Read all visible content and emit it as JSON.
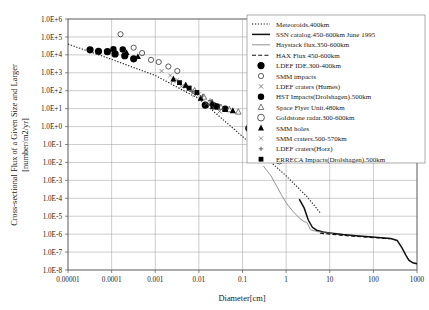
{
  "chart_data": {
    "type": "scatter",
    "title": "",
    "xlabel": "Diameter[cm]",
    "ylabel": "Cross-sectional Flux of a Given Size and Larger [number/m2/yr]",
    "ylabel_line1": "Cross-sectional Flux of a Given Size and Larger",
    "ylabel_line2": "[number/m2/yr]",
    "xscale": "log",
    "yscale": "log",
    "xlim": [
      1e-05,
      1000
    ],
    "ylim": [
      1e-08,
      1000000.0
    ],
    "grid": true,
    "legend_position": "top-right",
    "xticks": [
      "0.00001",
      "0.0001",
      "0.001",
      "0.01",
      "0.1",
      "1",
      "10",
      "100",
      "1000"
    ],
    "xtick_values": [
      1e-05,
      0.0001,
      0.001,
      0.01,
      0.1,
      1,
      10,
      100,
      1000
    ],
    "yticks": [
      "1.0E+6",
      "1.0E+5",
      "1.0E+4",
      "1.0E+3",
      "1.0E+2",
      "1.0E+1",
      "1.0E+0",
      "1.0E-1",
      "1.0E-2",
      "1.0E-3",
      "1.0E-4",
      "1.0E-5",
      "1.0E-6",
      "1.0E-7",
      "1.0E-8"
    ],
    "ytick_values": [
      1000000.0,
      100000.0,
      10000.0,
      1000.0,
      100.0,
      10.0,
      1.0,
      0.1,
      0.01,
      0.001,
      0.0001,
      1e-05,
      1e-06,
      1e-07,
      1e-08
    ],
    "series": [
      {
        "name": "Meteoroids.400km",
        "label": "Meteoroids.400km",
        "kind": "line",
        "style": "dotted",
        "color": "#222222",
        "marker": "none",
        "points": [
          [
            1e-05,
            4.6
          ],
          [
            0.0001,
            3.75
          ],
          [
            0.001,
            2.85
          ],
          [
            0.01,
            1.55
          ],
          [
            0.03,
            0.55
          ],
          [
            0.1,
            -0.55
          ],
          [
            0.3,
            -1.6
          ],
          [
            1.0,
            -2.75
          ],
          [
            3.0,
            -3.9
          ],
          [
            6.0,
            -4.8
          ]
        ]
      },
      {
        "name": "SSN catalog.450-600km June 1995",
        "label": "SSN catalog.450-600km June 1995",
        "kind": "line",
        "style": "solid-thick",
        "color": "#111111",
        "marker": "none",
        "points": [
          [
            2.0,
            -4.05
          ],
          [
            2.6,
            -4.55
          ],
          [
            3.2,
            -5.2
          ],
          [
            4.0,
            -5.62
          ],
          [
            5.0,
            -5.78
          ],
          [
            7.0,
            -5.88
          ],
          [
            10,
            -5.93
          ],
          [
            20,
            -6.02
          ],
          [
            40,
            -6.09
          ],
          [
            80,
            -6.15
          ],
          [
            150,
            -6.2
          ],
          [
            250,
            -6.24
          ],
          [
            350,
            -6.35
          ],
          [
            450,
            -6.75
          ],
          [
            550,
            -7.15
          ],
          [
            650,
            -7.45
          ],
          [
            800,
            -7.6
          ],
          [
            1000,
            -7.65
          ]
        ]
      },
      {
        "name": "Haystack flux.350-600km",
        "label": "Haystack flux.350-600km",
        "kind": "line",
        "style": "solid-thin",
        "color": "#777777",
        "marker": "none",
        "points": [
          [
            0.3,
            -2.2
          ],
          [
            0.45,
            -2.75
          ],
          [
            0.6,
            -3.3
          ],
          [
            0.8,
            -3.85
          ],
          [
            1.0,
            -4.25
          ],
          [
            1.4,
            -4.7
          ],
          [
            2.0,
            -5.1
          ],
          [
            2.6,
            -5.3
          ],
          [
            3.0,
            -5.35
          ],
          [
            3.6,
            -5.75
          ],
          [
            5.0,
            -5.85
          ],
          [
            8.0,
            -5.92
          ],
          [
            12,
            -5.97
          ]
        ]
      },
      {
        "name": "HAX Flux 450-600km",
        "label": "HAX Flux 450-600km",
        "kind": "line",
        "style": "dashed",
        "color": "#111111",
        "marker": "none",
        "points": [
          [
            6.0,
            -5.95
          ],
          [
            10,
            -6.0
          ],
          [
            20,
            -6.07
          ],
          [
            40,
            -6.13
          ],
          [
            80,
            -6.18
          ],
          [
            150,
            -6.22
          ],
          [
            250,
            -6.26
          ]
        ]
      },
      {
        "name": "LDEF IDE.300-400km",
        "label": "LDEF IDE.300-400km",
        "kind": "scatter",
        "marker": "filled-circle",
        "size": 3.6,
        "color": "#000000",
        "points": [
          [
            3.2e-05,
            4.28
          ],
          [
            5e-05,
            4.2
          ],
          [
            8e-05,
            4.18
          ],
          [
            0.00012,
            4.05
          ],
          [
            0.0002,
            3.95
          ],
          [
            0.00032,
            3.78
          ],
          [
            0.014,
            1.2
          ],
          [
            0.022,
            1.15
          ],
          [
            0.14,
            -0.1
          ],
          [
            0.24,
            -0.25
          ]
        ]
      },
      {
        "name": "SMM impacts",
        "label": "SMM impacts",
        "kind": "scatter",
        "marker": "open-circle",
        "size": 2.6,
        "color": "#333333",
        "points": [
          [
            0.00016,
            5.15
          ],
          [
            0.00032,
            4.4
          ],
          [
            0.0005,
            4.1
          ],
          [
            0.0008,
            3.72
          ],
          [
            0.0012,
            3.6
          ],
          [
            0.002,
            3.35
          ],
          [
            0.0032,
            3.1
          ]
        ]
      },
      {
        "name": "LDEF craters (Humes)",
        "label": "LDEF craters (Humes)",
        "kind": "scatter",
        "marker": "cross-x",
        "size": 2.2,
        "color": "#666666",
        "points": [
          [
            0.0026,
            2.55
          ],
          [
            0.004,
            2.25
          ],
          [
            0.0056,
            2.05
          ],
          [
            0.008,
            1.78
          ],
          [
            0.011,
            1.55
          ],
          [
            0.015,
            1.3
          ],
          [
            0.022,
            1.05
          ],
          [
            0.03,
            0.85
          ]
        ]
      },
      {
        "name": "HST Impacts(Drolshagen).500km",
        "label": "HST Impacts(Drolshagen).500km",
        "kind": "scatter",
        "marker": "filled-circle",
        "size": 3.2,
        "color": "#000000",
        "points": [
          [
            0.00011,
            4.32
          ],
          [
            0.00018,
            4.3
          ],
          [
            0.026,
            1.12
          ],
          [
            0.04,
            1.0
          ]
        ]
      },
      {
        "name": "Space Flyer Unit.480km",
        "label": "Space Flyer Unit.480km",
        "kind": "scatter",
        "marker": "open-triangle",
        "size": 2.8,
        "color": "#555555",
        "points": [
          [
            0.005,
            2.3
          ],
          [
            0.008,
            2.0
          ],
          [
            0.013,
            1.65
          ],
          [
            0.02,
            1.35
          ],
          [
            0.032,
            1.08
          ],
          [
            0.05,
            0.95
          ],
          [
            0.08,
            0.82
          ]
        ]
      },
      {
        "name": "Goldstone radar.300-600km",
        "label": "Goldstone radar.300-600km",
        "kind": "scatter",
        "marker": "open-circle",
        "size": 3.4,
        "color": "#333333",
        "points": [
          [
            0.28,
            -1.55
          ],
          [
            0.36,
            -1.6
          ],
          [
            0.45,
            -1.68
          ],
          [
            0.55,
            -1.75
          ],
          [
            0.7,
            -1.9
          ]
        ]
      },
      {
        "name": "SMM holes",
        "label": "SMM holes",
        "kind": "scatter",
        "marker": "filled-triangle",
        "size": 3.0,
        "color": "#000000",
        "points": [
          [
            0.00022,
            4.12
          ],
          [
            0.0004,
            3.9
          ],
          [
            0.0026,
            2.65
          ],
          [
            0.005,
            2.3
          ],
          [
            0.011,
            1.58
          ],
          [
            0.02,
            1.3
          ],
          [
            0.04,
            0.95
          ],
          [
            0.06,
            0.88
          ]
        ]
      },
      {
        "name": "SMM craters.500-570km",
        "label": "SMM craters.500-570km",
        "kind": "scatter",
        "marker": "cross-x",
        "size": 2.0,
        "color": "#777777",
        "points": [
          [
            0.0014,
            3.1
          ],
          [
            0.0022,
            2.85
          ],
          [
            0.0032,
            2.6
          ],
          [
            0.006,
            2.1
          ],
          [
            0.01,
            1.8
          ]
        ]
      },
      {
        "name": "LDEF craters(Horz)",
        "label": "LDEF craters(Horz)",
        "kind": "scatter",
        "marker": "plus",
        "size": 2.2,
        "color": "#555555",
        "points": [
          [
            0.007,
            1.95
          ],
          [
            0.012,
            1.7
          ],
          [
            0.018,
            1.45
          ]
        ]
      },
      {
        "name": "ERRECA Impacts(Drolshagen).500km",
        "label": "ERRECA Impacts(Drolshagen).500km",
        "kind": "scatter",
        "marker": "filled-square",
        "size": 2.4,
        "color": "#000000",
        "points": [
          [
            0.0036,
            2.45
          ],
          [
            0.006,
            2.15
          ],
          [
            0.009,
            1.9
          ]
        ]
      }
    ]
  }
}
